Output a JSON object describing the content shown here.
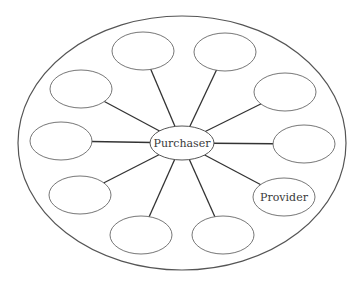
{
  "diagram": {
    "type": "hub-and-spoke",
    "outer": {
      "cx": 182,
      "cy": 143,
      "rx": 164,
      "ry": 127
    },
    "hub": {
      "label": "Purchaser",
      "cx": 182,
      "cy": 143,
      "rx": 32,
      "ry": 17
    },
    "nodes": [
      {
        "id": "n1",
        "label": "",
        "cx": 143,
        "cy": 51
      },
      {
        "id": "n2",
        "label": "",
        "cx": 225,
        "cy": 52
      },
      {
        "id": "n3",
        "label": "",
        "cx": 81,
        "cy": 89
      },
      {
        "id": "n4",
        "label": "",
        "cx": 285,
        "cy": 92
      },
      {
        "id": "n5",
        "label": "",
        "cx": 61,
        "cy": 141
      },
      {
        "id": "n6",
        "label": "",
        "cx": 304,
        "cy": 144
      },
      {
        "id": "n7",
        "label": "",
        "cx": 80,
        "cy": 195
      },
      {
        "id": "n8",
        "label": "Provider",
        "cx": 284,
        "cy": 197
      },
      {
        "id": "n9",
        "label": "",
        "cx": 141,
        "cy": 235
      },
      {
        "id": "n10",
        "label": "",
        "cx": 223,
        "cy": 235
      }
    ],
    "node_rx": 31,
    "node_ry": 19,
    "colors": {
      "stroke": "#555555",
      "spoke": "#333333",
      "text": "#3a3a3a",
      "background": "#ffffff"
    }
  }
}
